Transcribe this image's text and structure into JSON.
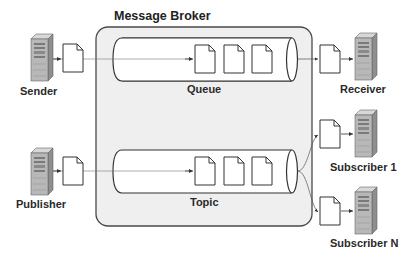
{
  "diagram": {
    "title": "Message Broker",
    "broker": {
      "label": "Message Broker",
      "fill": "#efefef",
      "stroke": "#4a4a4a"
    },
    "channels": [
      {
        "id": "queue",
        "label": "Queue",
        "message_count": 3
      },
      {
        "id": "topic",
        "label": "Topic",
        "message_count": 3
      }
    ],
    "producers": [
      {
        "id": "sender",
        "label": "Sender",
        "target": "queue"
      },
      {
        "id": "publisher",
        "label": "Publisher",
        "target": "topic"
      }
    ],
    "consumers": [
      {
        "id": "receiver",
        "label": "Receiver",
        "source": "queue"
      },
      {
        "id": "subscriber-1",
        "label": "Subscriber 1",
        "source": "topic"
      },
      {
        "id": "subscriber-n",
        "label": "Subscriber N",
        "source": "topic"
      }
    ],
    "icons": {
      "server": "server-tower-icon",
      "message": "document-icon"
    },
    "colors": {
      "server_body": "#b8b8b8",
      "server_side": "#8e8e8e",
      "line": "#555555",
      "document_fill": "#ffffff"
    }
  }
}
